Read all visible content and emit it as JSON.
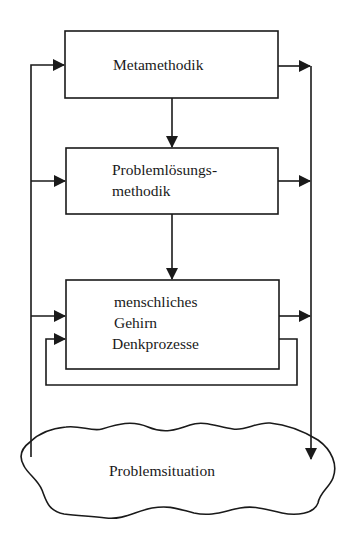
{
  "diagram": {
    "boxes": [
      {
        "id": "metamethodik",
        "lines": [
          "Metamethodik"
        ]
      },
      {
        "id": "problemloesungsmethodik",
        "lines": [
          "Problemlösungs-",
          "methodik"
        ]
      },
      {
        "id": "gehirn",
        "lines": [
          "menschliches",
          "Gehirn",
          "Denkprozesse"
        ]
      }
    ],
    "cloud": {
      "id": "problemsituation",
      "label": "Problemsituation"
    },
    "edges": [
      {
        "from": "metamethodik",
        "to": "problemloesungsmethodik"
      },
      {
        "from": "problemloesungsmethodik",
        "to": "gehirn"
      },
      {
        "from": "problemsituation",
        "to": "metamethodik"
      },
      {
        "from": "problemsituation",
        "to": "problemloesungsmethodik"
      },
      {
        "from": "problemsituation",
        "to": "gehirn"
      },
      {
        "from": "gehirn",
        "to": "gehirn",
        "type": "feedback-loop"
      },
      {
        "from": "metamethodik",
        "to": "problemsituation"
      },
      {
        "from": "problemloesungsmethodik",
        "to": "problemsituation"
      },
      {
        "from": "gehirn",
        "to": "problemsituation"
      }
    ],
    "colors": {
      "stroke": "#1a1a1a",
      "background": "#ffffff"
    }
  }
}
